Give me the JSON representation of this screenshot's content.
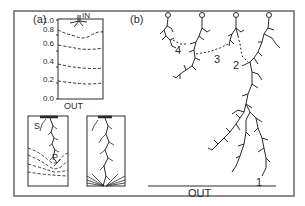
{
  "figure": {
    "panel_a": {
      "label": "(a)",
      "top_inset": {
        "inlet_label": "IN",
        "outlet_label": "OUT",
        "y_ticks": [
          "1.0",
          "0.8",
          "0.6",
          "0.4",
          "0.2",
          "0.0"
        ]
      },
      "bottom_left_inset": {
        "labels": [
          "S",
          "P"
        ]
      },
      "bottom_right_inset": {}
    },
    "panel_b": {
      "label": "(b)",
      "branch_labels": [
        "1",
        "2",
        "3",
        "4"
      ],
      "outlet_label": "OUT",
      "electrode_count": 4
    },
    "colors": {
      "line": "#2a2a2a",
      "frame": "#555555",
      "background": "#ffffff"
    }
  }
}
